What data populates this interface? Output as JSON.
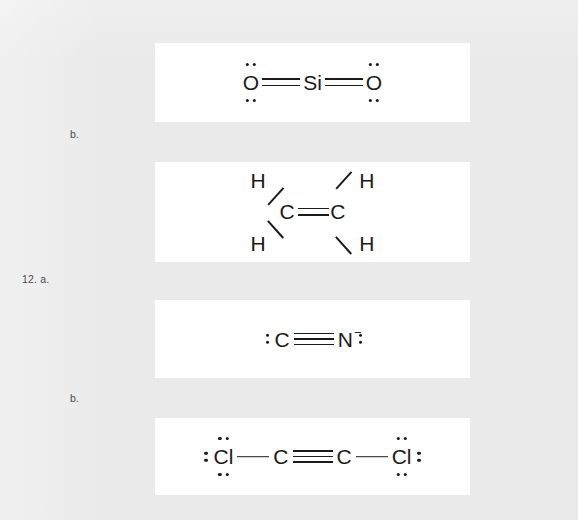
{
  "page": {
    "background_color": "#ebebeb",
    "panel_color": "#ffffff",
    "ink_color": "#1b1b1b"
  },
  "margin_labels": [
    {
      "id": "label-b-top",
      "text": "b."
    },
    {
      "id": "label-12-a",
      "text": "12. a."
    },
    {
      "id": "label-b-bottom",
      "text": "b."
    }
  ],
  "structures": [
    {
      "id": "silicon-dioxide",
      "name": "silicon dioxide Lewis structure",
      "atoms": [
        "O",
        "Si",
        "O"
      ],
      "bonds": [
        "double",
        "double"
      ],
      "left_atom": "O",
      "center_atom": "Si",
      "right_atom": "O",
      "charge": ""
    },
    {
      "id": "ethene",
      "name": "ethene Lewis structure",
      "atoms": [
        "H",
        "H",
        "C",
        "C",
        "H",
        "H"
      ],
      "h_top_left": "H",
      "h_top_right": "H",
      "h_bottom_left": "H",
      "h_bottom_right": "H",
      "carbon_left": "C",
      "carbon_right": "C",
      "bonds": [
        "double"
      ],
      "charge": ""
    },
    {
      "id": "cyanide-ion",
      "name": "cyanide ion Lewis structure",
      "atoms": [
        "C",
        "N"
      ],
      "left_atom": "C",
      "right_atom": "N",
      "bonds": [
        "triple"
      ],
      "charge": "−"
    },
    {
      "id": "dichloroacetylene",
      "name": "dichloroacetylene Lewis structure",
      "atoms": [
        "Cl",
        "C",
        "C",
        "Cl"
      ],
      "left_atom": "Cl",
      "carbon_left": "C",
      "carbon_right": "C",
      "right_atom": "Cl",
      "bonds": [
        "single",
        "triple",
        "single"
      ],
      "charge": ""
    }
  ]
}
